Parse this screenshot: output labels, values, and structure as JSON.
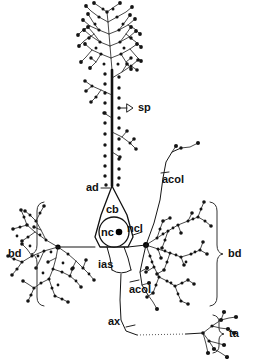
{
  "figure": {
    "ink_color": "#151515",
    "background_color": "#ffffff"
  },
  "labels": {
    "spine": "sp",
    "apical_dendrite": "ad",
    "cell_body": "cb",
    "nucleus": "nc",
    "nucleolus": "ncl",
    "basal_dendrite_left": "bd",
    "basal_dendrite_right": "bd",
    "initial_axon_segment": "ias",
    "axon_collateral_upper": "acol",
    "axon_collateral_lower": "acol",
    "axon": "ax",
    "terminal_arborization": "ta"
  }
}
